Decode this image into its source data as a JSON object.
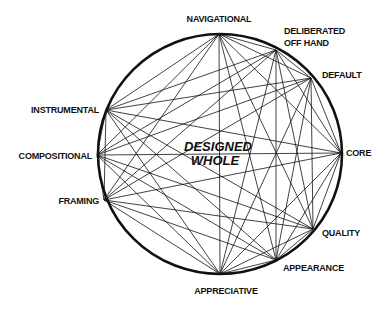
{
  "diagram": {
    "center": {
      "x": 220,
      "y": 154,
      "rx": 122,
      "ry": 120
    },
    "center_label": [
      "DESIGNED",
      "WHOLE"
    ],
    "nodes": [
      {
        "id": "navigational",
        "label": [
          "NAVIGATIONAL"
        ],
        "x": 219,
        "y": 34,
        "lx": 219,
        "ly": 22,
        "anchor": "middle"
      },
      {
        "id": "deliberated",
        "label": [
          "DELIBERATED",
          "OFF HAND"
        ],
        "x": 276,
        "y": 50,
        "lx": 284,
        "ly": 34,
        "anchor": "start"
      },
      {
        "id": "default",
        "label": [
          "DEFAULT"
        ],
        "x": 311,
        "y": 78,
        "lx": 322,
        "ly": 78,
        "anchor": "start"
      },
      {
        "id": "core",
        "label": [
          "CORE"
        ],
        "x": 341,
        "y": 153,
        "lx": 346,
        "ly": 156,
        "anchor": "start"
      },
      {
        "id": "quality",
        "label": [
          "QUALITY"
        ],
        "x": 313,
        "y": 229,
        "lx": 322,
        "ly": 236,
        "anchor": "start"
      },
      {
        "id": "appearance",
        "label": [
          "APPEARANCE"
        ],
        "x": 276,
        "y": 260,
        "lx": 283,
        "ly": 271,
        "anchor": "start"
      },
      {
        "id": "appreciative",
        "label": [
          "APPRECIATIVE"
        ],
        "x": 220,
        "y": 274,
        "lx": 226,
        "ly": 294,
        "anchor": "middle"
      },
      {
        "id": "framing",
        "label": [
          "FRAMING"
        ],
        "x": 104,
        "y": 200,
        "lx": 99,
        "ly": 204,
        "anchor": "end"
      },
      {
        "id": "compositional",
        "label": [
          "COMPOSITIONAL"
        ],
        "x": 97,
        "y": 155,
        "lx": 92,
        "ly": 159,
        "anchor": "end"
      },
      {
        "id": "instrumental",
        "label": [
          "INSTRUMENTAL"
        ],
        "x": 106,
        "y": 110,
        "lx": 99,
        "ly": 113,
        "anchor": "end"
      }
    ],
    "edges": "complete",
    "colors": {
      "line": "#111111",
      "circle": "#111111",
      "text": "#111111",
      "background": "#ffffff"
    }
  }
}
